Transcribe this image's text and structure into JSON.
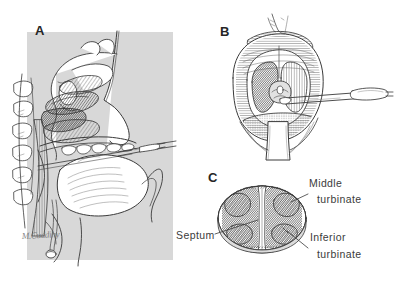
{
  "figure": {
    "background_color": "#ffffff",
    "ink_color": "#3a3a3a",
    "shade_color": "#d9d9d9",
    "dark_shade_color": "#8c8c8c",
    "width": 395,
    "height": 281
  },
  "panels": [
    {
      "id": "A",
      "letter": "A",
      "name": "sagittal-section-panel",
      "caption": "",
      "backdrop_color": "#d8d8d8"
    },
    {
      "id": "B",
      "letter": "B",
      "name": "open-mouth-view-panel",
      "caption": ""
    },
    {
      "id": "C",
      "letter": "C",
      "name": "nasal-cross-section-panel",
      "caption": ""
    }
  ],
  "annotations": {
    "middle_turbinate": {
      "line1": "Middle",
      "line2": "turbinate"
    },
    "inferior_turbinate": {
      "line1": "Inferior",
      "line2": "turbinate"
    },
    "septum": {
      "line1": "Septum"
    }
  },
  "signature": {
    "text": "M.Cuddihy"
  }
}
